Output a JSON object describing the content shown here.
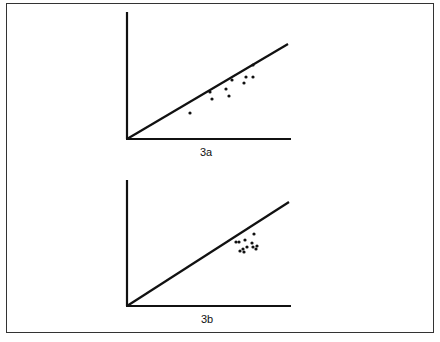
{
  "chart_data": [
    {
      "type": "scatter",
      "title": "3a",
      "xlabel": "",
      "ylabel": "",
      "reference_line": {
        "from": [
          0,
          0
        ],
        "to": [
          1,
          0.76
        ],
        "note": "diagonal line from origin"
      },
      "points_px": [
        [
          190,
          113
        ],
        [
          210,
          92
        ],
        [
          212,
          99
        ],
        [
          226,
          89
        ],
        [
          229,
          96
        ],
        [
          232,
          80
        ],
        [
          244,
          83
        ],
        [
          246,
          77
        ],
        [
          253,
          77
        ],
        [
          253,
          65
        ]
      ],
      "grid": false
    },
    {
      "type": "scatter",
      "title": "3b",
      "xlabel": "",
      "ylabel": "",
      "reference_line": {
        "from": [
          0,
          0
        ],
        "to": [
          1,
          0.76
        ],
        "note": "diagonal line from origin"
      },
      "points_px": [
        [
          236,
          242
        ],
        [
          239,
          242
        ],
        [
          245,
          240
        ],
        [
          254,
          234
        ],
        [
          252,
          243
        ],
        [
          253,
          247
        ],
        [
          247,
          247
        ],
        [
          243,
          249
        ],
        [
          240,
          251
        ],
        [
          244,
          252
        ],
        [
          256,
          249
        ],
        [
          257,
          246
        ]
      ],
      "grid": false
    }
  ],
  "labels": {
    "a": "3a",
    "b": "3b"
  }
}
